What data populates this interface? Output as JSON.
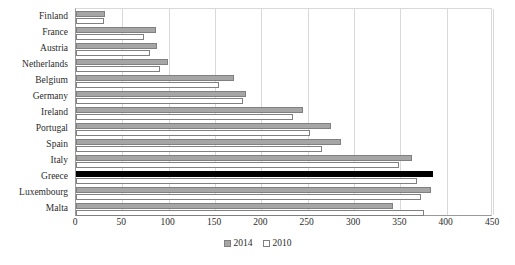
{
  "chart_data": {
    "type": "bar",
    "orientation": "horizontal",
    "title": "",
    "xlabel": "",
    "ylabel": "",
    "xlim": [
      0,
      450
    ],
    "xticks": [
      0,
      50,
      100,
      150,
      200,
      250,
      300,
      350,
      400,
      450
    ],
    "grid": true,
    "legend_position": "bottom",
    "categories": [
      "Finland",
      "France",
      "Austria",
      "Netherlands",
      "Belgium",
      "Germany",
      "Ireland",
      "Portugal",
      "Spain",
      "Italy",
      "Greece",
      "Luxembourg",
      "Malta"
    ],
    "series": [
      {
        "name": "2014",
        "color": "#a6a6a6",
        "highlight_category": "Greece",
        "highlight_color": "#000000",
        "values": [
          31,
          86,
          87,
          99,
          170,
          183,
          245,
          275,
          286,
          363,
          385,
          383,
          342
        ]
      },
      {
        "name": "2010",
        "color": "#ffffff",
        "values": [
          30,
          73,
          80,
          91,
          154,
          180,
          234,
          253,
          266,
          349,
          368,
          372,
          375
        ]
      }
    ]
  },
  "legend": {
    "items": [
      {
        "label": "2014",
        "swatch": "gray-square-icon"
      },
      {
        "label": "2010",
        "swatch": "white-square-icon"
      }
    ]
  }
}
